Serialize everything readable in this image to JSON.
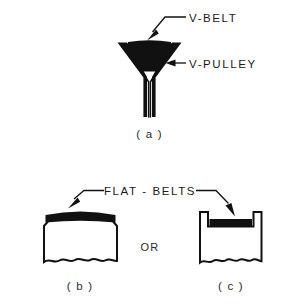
{
  "figure": {
    "title_absent": true,
    "background_color": "#ffffff",
    "ink_color": "#111111",
    "labels": {
      "v_belt": "V-BELT",
      "v_pulley": "V-PULLEY",
      "flat_belts": "FLAT - BELTS",
      "or": "OR"
    },
    "captions": {
      "a": "( a )",
      "b": "( b )",
      "c": "( c )"
    },
    "panels": [
      {
        "id": "a",
        "caption": "( a )",
        "description": "V-belt seated in a grooved V-pulley cross-section",
        "parts": [
          "V-BELT",
          "V-PULLEY"
        ]
      },
      {
        "id": "b",
        "caption": "( b )",
        "description": "Flat belt on a crowned flat-face pulley cross-section",
        "parts": [
          "FLAT - BELTS"
        ]
      },
      {
        "id": "c",
        "caption": "( c )",
        "description": "Flat belt on a flanged pulley cross-section",
        "parts": [
          "FLAT - BELTS"
        ]
      }
    ],
    "annotations": [
      {
        "name": "v-belt-leader",
        "target": "v-belt",
        "arrow": "down-left"
      },
      {
        "name": "v-pulley-leader",
        "target": "v-pulley-flank",
        "arrow": "left"
      },
      {
        "name": "flat-belts-leader-b",
        "target": "flat-belt-on-crowned-pulley",
        "arrow": "down-left"
      },
      {
        "name": "flat-belts-leader-c",
        "target": "flat-belt-on-flanged-pulley",
        "arrow": "down-right"
      }
    ]
  }
}
